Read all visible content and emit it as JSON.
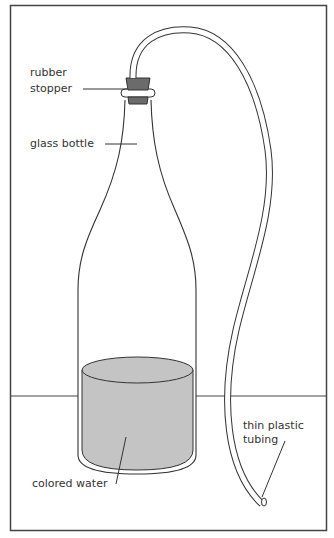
{
  "diagram": {
    "title": "",
    "labels": {
      "stopper_line1": "rubber",
      "stopper_line2": "stopper",
      "bottle": "glass bottle",
      "water": "colored water",
      "tubing_line1": "thin plastic",
      "tubing_line2": "tubing"
    },
    "colors": {
      "stroke": "#333333",
      "stopper": "#6b6b6b",
      "water": "#c4c4c4",
      "background": "#ffffff"
    }
  }
}
